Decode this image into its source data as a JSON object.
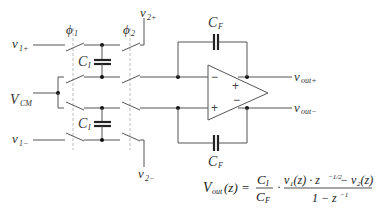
{
  "diagram": {
    "labels": {
      "v1p": "v",
      "v1p_sub": "1+",
      "v1m": "v",
      "v1m_sub": "1−",
      "v2p": "v",
      "v2p_sub": "2+",
      "v2m": "v",
      "v2m_sub": "2−",
      "vcm": "V",
      "vcm_sub": "CM",
      "phi1": "ϕ",
      "phi1_sub": "1",
      "phi2": "ϕ",
      "phi2_sub": "2",
      "ci_top": "C",
      "ci_top_sub": "I",
      "ci_bot": "C",
      "ci_bot_sub": "I",
      "cf_top": "C",
      "cf_top_sub": "F",
      "cf_bot": "C",
      "cf_bot_sub": "F",
      "voutp": "v",
      "voutp_sub": "out+",
      "voutm": "v",
      "voutm_sub": "out−"
    },
    "opamp": {
      "in_minus": "−",
      "in_plus": "+",
      "out_plus": "+",
      "out_minus": "−"
    },
    "equation": {
      "lhs": "V",
      "lhs_sub": "out",
      "lhs_arg": "(z) =",
      "frac1_num": "C",
      "frac1_num_sub": "I",
      "frac1_den": "C",
      "frac1_den_sub": "F",
      "dot": "·",
      "frac2_num": "v₁(z) · z",
      "frac2_num_exp": "−1/2",
      "frac2_num_rest": " − v₂(z)",
      "frac2_den": "1 − z",
      "frac2_den_exp": "−1"
    }
  }
}
